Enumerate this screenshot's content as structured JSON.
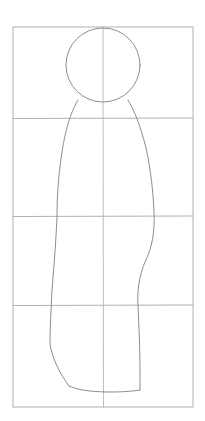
{
  "document": {
    "kind": "pencil-sketch",
    "subject": "human-figure-proportion-study",
    "title": "",
    "caption": "",
    "background_color": "#ffffff"
  },
  "canvas": {
    "width": 205,
    "height": 421
  },
  "palette": {
    "paper": "#ffffff",
    "grid_stroke": "#a8a8a8",
    "grid_stroke_light": "#b5b5b5",
    "figure_stroke": "#8c8c8c",
    "figure_stroke_dark": "#7a7a7a"
  },
  "grid": {
    "label": "construction grid",
    "frame": {
      "x": 13,
      "y": 27,
      "width": 180,
      "height": 380
    },
    "columns": 2,
    "rows": 4,
    "vertical_lines": [
      {
        "name": "center-axis",
        "x": 103,
        "y1": 27,
        "y2": 407
      }
    ],
    "horizontal_lines": [
      {
        "name": "grid-line-1",
        "y": 118,
        "x1": 13,
        "x2": 193
      },
      {
        "name": "grid-line-2",
        "y": 216,
        "x1": 13,
        "x2": 193
      },
      {
        "name": "grid-line-3",
        "y": 305,
        "x1": 13,
        "x2": 193
      }
    ],
    "stroke_width": 0.8,
    "style": "hand-drawn"
  },
  "figure": {
    "label": "stylised standing figure",
    "head": {
      "name": "head-circle",
      "center_x": 103,
      "center_y": 65,
      "radius_x": 37,
      "radius_y": 37,
      "stroke_width": 0.9
    },
    "body": {
      "name": "torso-and-legs-outline",
      "stroke_width": 0.9,
      "left_contour": "M 78 100 C 72 110 66 126 62 152 C 58 178 57 198 57 217 C 56 240 54 266 52 290 C 51 310 50 330 50 344 C 52 358 60 374 69 386",
      "right_contour": "M 128 100 C 134 110 140 124 146 148 C 151 170 153 192 154 212 C 155 232 152 248 145 262 C 139 276 137 292 138 306 C 139 326 140 352 140 372 C 140 380 140 386 140 390",
      "bottom_edge": "M 69 386 C 80 391 96 392 112 392 C 124 392 134 391 140 390"
    },
    "measurements": {
      "total_height_px": 363,
      "head_height_px": 74,
      "heads_tall": "approx 5",
      "shoulder_width_px": 50,
      "hip_width_px": 97,
      "hem_width_px": 71
    }
  },
  "annotations": {
    "text_labels": [],
    "note": ""
  }
}
